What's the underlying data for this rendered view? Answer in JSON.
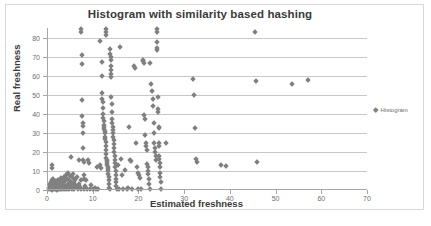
{
  "chart_data": {
    "type": "scatter",
    "title": "Histogram with similarity based hashing",
    "xlabel": "Estimated freshness",
    "ylabel": "Real freshness",
    "xlim": [
      0,
      70
    ],
    "ylim": [
      0,
      85
    ],
    "xticks": [
      0,
      10,
      20,
      30,
      40,
      50,
      60,
      70
    ],
    "yticks": [
      0,
      10,
      20,
      30,
      40,
      50,
      60,
      70,
      80
    ],
    "grid": "horizontal",
    "legend_position": "right",
    "marker": "diamond",
    "marker_color": "#808080",
    "series": [
      {
        "name": "Histogram",
        "points": [
          [
            0.4,
            0.3
          ],
          [
            0.5,
            1.2
          ],
          [
            0.6,
            2.0
          ],
          [
            0.7,
            3.1
          ],
          [
            0.8,
            0.5
          ],
          [
            0.9,
            4.2
          ],
          [
            1.0,
            0.2
          ],
          [
            1.0,
            5.0
          ],
          [
            1.1,
            11.5
          ],
          [
            1.2,
            13.0
          ],
          [
            1.2,
            2.5
          ],
          [
            1.3,
            0.4
          ],
          [
            1.4,
            6.0
          ],
          [
            1.5,
            1.0
          ],
          [
            1.6,
            3.5
          ],
          [
            1.7,
            0.3
          ],
          [
            1.8,
            2.2
          ],
          [
            1.9,
            4.6
          ],
          [
            2.0,
            0.5
          ],
          [
            2.1,
            1.8
          ],
          [
            2.2,
            0.2
          ],
          [
            2.3,
            3.0
          ],
          [
            2.4,
            5.5
          ],
          [
            2.5,
            0.6
          ],
          [
            2.6,
            2.8
          ],
          [
            2.7,
            1.4
          ],
          [
            2.8,
            0.3
          ],
          [
            2.9,
            4.0
          ],
          [
            3.0,
            6.5
          ],
          [
            3.1,
            0.4
          ],
          [
            3.2,
            2.0
          ],
          [
            3.3,
            5.0
          ],
          [
            3.4,
            1.0
          ],
          [
            3.5,
            3.2
          ],
          [
            3.6,
            0.5
          ],
          [
            3.7,
            7.0
          ],
          [
            3.8,
            2.5
          ],
          [
            3.9,
            0.3
          ],
          [
            4.0,
            4.5
          ],
          [
            4.1,
            8.0
          ],
          [
            4.2,
            1.5
          ],
          [
            4.3,
            6.0
          ],
          [
            4.4,
            0.4
          ],
          [
            4.5,
            3.0
          ],
          [
            4.6,
            9.0
          ],
          [
            4.7,
            2.0
          ],
          [
            4.8,
            5.5
          ],
          [
            4.9,
            0.6
          ],
          [
            5.0,
            7.5
          ],
          [
            5.1,
            1.2
          ],
          [
            5.2,
            4.0
          ],
          [
            5.3,
            17.5
          ],
          [
            5.4,
            0.3
          ],
          [
            5.5,
            2.5
          ],
          [
            5.6,
            6.5
          ],
          [
            5.7,
            8.5
          ],
          [
            5.8,
            1.0
          ],
          [
            5.9,
            3.5
          ],
          [
            6.0,
            0.5
          ],
          [
            6.2,
            5.0
          ],
          [
            6.4,
            2.0
          ],
          [
            6.6,
            7.0
          ],
          [
            6.8,
            0.4
          ],
          [
            7.0,
            3.0
          ],
          [
            7.0,
            16.0
          ],
          [
            7.2,
            1.5
          ],
          [
            7.4,
            5.5
          ],
          [
            7.5,
            0.3
          ],
          [
            7.5,
            84.5
          ],
          [
            7.5,
            83.0
          ],
          [
            7.6,
            71.0
          ],
          [
            7.6,
            66.0
          ],
          [
            7.7,
            47.0
          ],
          [
            7.7,
            39.0
          ],
          [
            7.8,
            35.0
          ],
          [
            7.8,
            33.5
          ],
          [
            7.8,
            30.0
          ],
          [
            7.9,
            22.0
          ],
          [
            7.9,
            15.5
          ],
          [
            8.0,
            14.5
          ],
          [
            8.0,
            8.0
          ],
          [
            8.1,
            6.0
          ],
          [
            8.2,
            0.4
          ],
          [
            8.4,
            2.0
          ],
          [
            8.6,
            5.0
          ],
          [
            8.8,
            0.3
          ],
          [
            9.0,
            15.5
          ],
          [
            9.2,
            14.0
          ],
          [
            9.4,
            0.5
          ],
          [
            9.6,
            2.5
          ],
          [
            10.0,
            0.4
          ],
          [
            10.4,
            1.0
          ],
          [
            10.8,
            0.3
          ],
          [
            11.0,
            12.0
          ],
          [
            11.2,
            0.5
          ],
          [
            11.5,
            78.0
          ],
          [
            11.6,
            13.0
          ],
          [
            11.8,
            11.5
          ],
          [
            12.0,
            67.0
          ],
          [
            12.0,
            60.0
          ],
          [
            12.1,
            51.0
          ],
          [
            12.1,
            48.0
          ],
          [
            12.2,
            46.0
          ],
          [
            12.2,
            43.0
          ],
          [
            12.3,
            40.0
          ],
          [
            12.3,
            38.0
          ],
          [
            12.4,
            36.0
          ],
          [
            12.4,
            34.0
          ],
          [
            12.5,
            33.0
          ],
          [
            12.5,
            32.0
          ],
          [
            12.6,
            31.0
          ],
          [
            12.6,
            30.0
          ],
          [
            12.7,
            28.0
          ],
          [
            12.7,
            26.5
          ],
          [
            12.8,
            25.0
          ],
          [
            12.8,
            23.0
          ],
          [
            12.9,
            21.0
          ],
          [
            12.9,
            19.0
          ],
          [
            13.0,
            84.5
          ],
          [
            13.0,
            83.0
          ],
          [
            13.0,
            81.5
          ],
          [
            13.0,
            17.0
          ],
          [
            13.1,
            16.0
          ],
          [
            13.1,
            15.0
          ],
          [
            13.2,
            14.0
          ],
          [
            13.2,
            13.0
          ],
          [
            13.3,
            12.0
          ],
          [
            13.3,
            11.0
          ],
          [
            13.4,
            10.0
          ],
          [
            13.4,
            8.5
          ],
          [
            13.5,
            7.0
          ],
          [
            13.5,
            5.0
          ],
          [
            13.6,
            3.0
          ],
          [
            13.6,
            1.0
          ],
          [
            13.7,
            0.3
          ],
          [
            13.8,
            74.0
          ],
          [
            13.8,
            71.5
          ],
          [
            13.9,
            70.0
          ],
          [
            13.9,
            68.0
          ],
          [
            14.0,
            65.0
          ],
          [
            14.0,
            63.0
          ],
          [
            14.0,
            61.0
          ],
          [
            14.1,
            59.5
          ],
          [
            14.1,
            49.0
          ],
          [
            14.2,
            45.0
          ],
          [
            14.2,
            41.0
          ],
          [
            14.3,
            37.0
          ],
          [
            14.3,
            35.0
          ],
          [
            14.4,
            33.0
          ],
          [
            14.4,
            31.5
          ],
          [
            14.5,
            30.0
          ],
          [
            14.5,
            28.0
          ],
          [
            14.6,
            26.0
          ],
          [
            14.6,
            24.0
          ],
          [
            14.7,
            22.0
          ],
          [
            14.7,
            20.0
          ],
          [
            14.8,
            18.0
          ],
          [
            14.8,
            16.0
          ],
          [
            14.9,
            14.0
          ],
          [
            14.9,
            12.0
          ],
          [
            15.0,
            10.0
          ],
          [
            15.0,
            8.0
          ],
          [
            15.1,
            6.0
          ],
          [
            15.1,
            4.0
          ],
          [
            15.2,
            2.0
          ],
          [
            15.3,
            0.4
          ],
          [
            15.6,
            13.0
          ],
          [
            15.8,
            0.5
          ],
          [
            16.0,
            75.0
          ],
          [
            16.2,
            16.5
          ],
          [
            16.4,
            8.0
          ],
          [
            16.6,
            0.3
          ],
          [
            17.0,
            10.5
          ],
          [
            17.4,
            0.4
          ],
          [
            17.8,
            1.0
          ],
          [
            18.0,
            33.0
          ],
          [
            18.2,
            16.0
          ],
          [
            18.4,
            15.0
          ],
          [
            18.6,
            0.5
          ],
          [
            19.0,
            65.0
          ],
          [
            19.2,
            64.0
          ],
          [
            19.4,
            24.5
          ],
          [
            19.6,
            12.0
          ],
          [
            19.8,
            9.0
          ],
          [
            20.0,
            0.3
          ],
          [
            20.2,
            8.0
          ],
          [
            20.4,
            6.5
          ],
          [
            20.6,
            0.4
          ],
          [
            21.0,
            68.0
          ],
          [
            21.1,
            67.5
          ],
          [
            21.2,
            66.5
          ],
          [
            21.3,
            39.5
          ],
          [
            21.4,
            37.0
          ],
          [
            21.5,
            29.0
          ],
          [
            21.6,
            24.5
          ],
          [
            21.7,
            23.0
          ],
          [
            21.8,
            21.0
          ],
          [
            21.9,
            13.5
          ],
          [
            22.0,
            12.0
          ],
          [
            22.1,
            10.0
          ],
          [
            22.2,
            8.5
          ],
          [
            22.3,
            6.0
          ],
          [
            22.4,
            3.0
          ],
          [
            22.5,
            0.3
          ],
          [
            22.6,
            66.5
          ],
          [
            22.8,
            55.5
          ],
          [
            23.0,
            52.0
          ],
          [
            23.1,
            48.0
          ],
          [
            23.2,
            44.0
          ],
          [
            23.3,
            35.0
          ],
          [
            23.4,
            30.0
          ],
          [
            23.5,
            24.5
          ],
          [
            23.6,
            22.0
          ],
          [
            23.7,
            20.0
          ],
          [
            23.8,
            18.0
          ],
          [
            23.9,
            16.0
          ],
          [
            24.0,
            84.5
          ],
          [
            24.0,
            83.0
          ],
          [
            24.0,
            77.5
          ],
          [
            24.1,
            74.5
          ],
          [
            24.1,
            73.5
          ],
          [
            24.2,
            49.0
          ],
          [
            24.3,
            42.5
          ],
          [
            24.3,
            41.0
          ],
          [
            24.4,
            33.0
          ],
          [
            24.4,
            32.5
          ],
          [
            24.5,
            24.5
          ],
          [
            24.5,
            23.0
          ],
          [
            24.6,
            18.0
          ],
          [
            24.6,
            16.5
          ],
          [
            24.7,
            14.0
          ],
          [
            24.7,
            12.0
          ],
          [
            24.8,
            9.0
          ],
          [
            24.8,
            7.0
          ],
          [
            24.9,
            4.0
          ],
          [
            25.0,
            0.4
          ],
          [
            26.0,
            24.5
          ],
          [
            32.0,
            58.0
          ],
          [
            32.2,
            50.0
          ],
          [
            32.4,
            32.5
          ],
          [
            32.6,
            16.5
          ],
          [
            32.8,
            14.5
          ],
          [
            38.0,
            13.0
          ],
          [
            39.2,
            12.5
          ],
          [
            45.5,
            83.0
          ],
          [
            45.8,
            57.0
          ],
          [
            45.9,
            14.5
          ],
          [
            53.5,
            55.5
          ],
          [
            57.0,
            57.5
          ]
        ]
      }
    ]
  },
  "legend": {
    "entries": [
      {
        "label": "Histogram",
        "marker": "diamond",
        "color": "#808080"
      }
    ]
  }
}
